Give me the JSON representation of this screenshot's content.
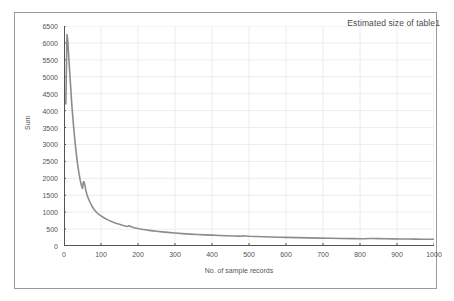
{
  "window": {
    "frame_border_color": "#9a9a9a",
    "background": "#ffffff"
  },
  "chart_data": {
    "type": "line",
    "title": "Estimated size of table1",
    "xlabel": "No. of sample records",
    "ylabel": "Sum",
    "xlim": [
      0,
      1000
    ],
    "ylim": [
      0,
      6500
    ],
    "grid": true,
    "legend": "none",
    "line_color": "#8c8c8c",
    "grid_color": "#ececec",
    "axis_color": "#555555",
    "xticks": [
      0,
      100,
      200,
      300,
      400,
      500,
      600,
      700,
      800,
      900,
      1000
    ],
    "xtick_labels": [
      "0",
      "100",
      "200",
      "300",
      "400",
      "500",
      "600",
      "700",
      "800",
      "900",
      "1000"
    ],
    "yticks": [
      0,
      500,
      1000,
      1500,
      2000,
      2500,
      3000,
      3500,
      4000,
      4500,
      5000,
      5500,
      6000,
      6500
    ],
    "ytick_labels": [
      "0",
      "500",
      "1000",
      "1500",
      "2000",
      "2500",
      "3000",
      "3500",
      "4000",
      "4500",
      "5000",
      "5500",
      "6000",
      "6500"
    ],
    "series": [
      {
        "name": "Estimated size of table1",
        "x": [
          5,
          8,
          10,
          12,
          15,
          18,
          20,
          22,
          25,
          28,
          30,
          33,
          36,
          40,
          44,
          47,
          50,
          52,
          54,
          56,
          58,
          60,
          63,
          66,
          70,
          75,
          80,
          85,
          90,
          95,
          100,
          110,
          120,
          130,
          140,
          150,
          160,
          168,
          172,
          175,
          178,
          182,
          186,
          190,
          200,
          210,
          220,
          230,
          240,
          250,
          265,
          280,
          300,
          320,
          340,
          360,
          380,
          400,
          420,
          440,
          460,
          470,
          478,
          484,
          490,
          500,
          520,
          540,
          560,
          580,
          600,
          630,
          660,
          690,
          720,
          750,
          780,
          800,
          815,
          825,
          835,
          850,
          870,
          890,
          910,
          930,
          950,
          970,
          985,
          1000
        ],
        "y": [
          4200,
          6250,
          6100,
          5750,
          5200,
          4700,
          4350,
          4050,
          3650,
          3280,
          3050,
          2750,
          2480,
          2180,
          1930,
          1790,
          1700,
          1880,
          1900,
          1820,
          1700,
          1600,
          1480,
          1400,
          1300,
          1190,
          1100,
          1030,
          975,
          930,
          890,
          820,
          765,
          715,
          675,
          640,
          608,
          585,
          575,
          600,
          590,
          570,
          552,
          540,
          515,
          495,
          478,
          462,
          448,
          436,
          418,
          402,
          382,
          366,
          352,
          340,
          330,
          320,
          312,
          304,
          296,
          292,
          288,
          300,
          296,
          288,
          280,
          273,
          266,
          260,
          255,
          246,
          239,
          233,
          228,
          223,
          218,
          215,
          213,
          222,
          220,
          217,
          213,
          210,
          207,
          205,
          203,
          201,
          200,
          198
        ]
      }
    ]
  }
}
